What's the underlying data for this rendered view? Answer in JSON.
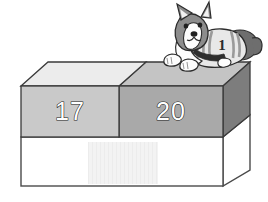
{
  "scene": {
    "title": "Two stacked blocks labeled with numbers and a dog on top",
    "background_color": "#ffffff",
    "width": 268,
    "height": 202
  },
  "blocks": [
    {
      "id": "left-block",
      "label": "17",
      "front_color": "#c9c9c9",
      "top_color": "#ececec",
      "outline_color": "#3a3a3a",
      "label_fill": "#ffffff",
      "label_outline": "#1a1a1a"
    },
    {
      "id": "right-block",
      "label": "20",
      "front_color": "#a9a9a9",
      "top_color": "#c4c4c4",
      "side_color": "#7d7d7d",
      "outline_color": "#3a3a3a",
      "label_fill": "#ffffff",
      "label_outline": "#1a1a1a"
    },
    {
      "id": "base-block",
      "label": "",
      "front_color": "#ffffff",
      "side_color": "#ffffff",
      "outline_color": "#4a4a4a",
      "patch_color": "#f0f0f0"
    }
  ],
  "dog": {
    "name": "corgi-dog",
    "jersey_number": "1",
    "fur_gray": "#8c8c8c",
    "fur_dark": "#666666",
    "fur_white": "#fcfcfc",
    "jersey_light": "#e8e8e8",
    "jersey_stripe": "#9a9a9a",
    "collar_color": "#2e2e2e",
    "nose_color": "#1f1f1f",
    "outline_color": "#2b2b2b"
  }
}
